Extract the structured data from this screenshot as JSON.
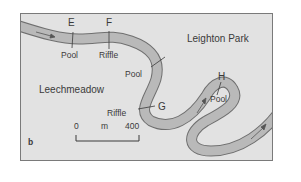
{
  "map": {
    "panel_label": "b",
    "regions": [
      {
        "name": "Leighton Park"
      },
      {
        "name": "Leechmeadow"
      }
    ],
    "sites": [
      {
        "id": "E",
        "feature": "Pool"
      },
      {
        "id": "F",
        "feature": "Riffle"
      },
      {
        "id": "unlabeled",
        "feature": "Pool"
      },
      {
        "id": "G",
        "feature": "Riffle"
      },
      {
        "id": "H",
        "feature": "Pool"
      }
    ],
    "scale_bar": {
      "start": "0",
      "unit": "m",
      "end": "400"
    },
    "colors": {
      "land": "#e2e2e2",
      "river_fill": "#b9b9b9",
      "river_outline": "#6f6f6f",
      "text": "#3a3a3a"
    },
    "flow_arrows": 4
  }
}
